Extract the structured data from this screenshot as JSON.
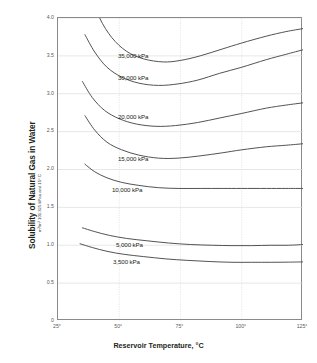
{
  "chart_data": {
    "type": "line",
    "title": "",
    "xlabel": "Reservoir Temperature, °C",
    "ylabel": "Solubility of Natural Gas in Water",
    "ylabel_sub": "m³/m³ 101.325 kPaa and 15° C",
    "xlim": [
      25,
      125
    ],
    "ylim": [
      0,
      4.0
    ],
    "grid": true,
    "legend": "inline-labels",
    "xticks": [
      "25°",
      "50°",
      "75°",
      "100°",
      "125°"
    ],
    "xtick_values": [
      25,
      50,
      75,
      100,
      125
    ],
    "yticks": [
      "0",
      "0.5",
      "1.0",
      "1.5",
      "2.0",
      "2.5",
      "3.0",
      "3.5",
      "4.0"
    ],
    "ytick_values": [
      0,
      0.5,
      1.0,
      1.5,
      2.0,
      2.5,
      3.0,
      3.5,
      4.0
    ],
    "series": [
      {
        "name": "35,000 kPa",
        "label": "35,000 kPa",
        "x": [
          38,
          42,
          47,
          53,
          60,
          68,
          75,
          83,
          92,
          100,
          110,
          118,
          125
        ],
        "y": [
          4.35,
          4.0,
          3.74,
          3.56,
          3.46,
          3.42,
          3.44,
          3.5,
          3.59,
          3.67,
          3.76,
          3.82,
          3.86
        ]
      },
      {
        "name": "30,000 kPa",
        "label": "30,000 kPa",
        "x": [
          36,
          40,
          45,
          51,
          58,
          66,
          74,
          82,
          91,
          100,
          110,
          118,
          125
        ],
        "y": [
          3.78,
          3.55,
          3.35,
          3.22,
          3.14,
          3.11,
          3.13,
          3.18,
          3.27,
          3.35,
          3.45,
          3.52,
          3.58
        ]
      },
      {
        "name": "20,000 kPa",
        "label": "20,000 kPa",
        "x": [
          35,
          39,
          44,
          50,
          57,
          65,
          73,
          82,
          91,
          100,
          110,
          118,
          125
        ],
        "y": [
          3.16,
          2.95,
          2.78,
          2.67,
          2.6,
          2.57,
          2.58,
          2.62,
          2.68,
          2.74,
          2.81,
          2.85,
          2.88
        ]
      },
      {
        "name": "15,000 kPa",
        "label": "15,000 kPa",
        "x": [
          36,
          40,
          45,
          51,
          58,
          66,
          74,
          83,
          92,
          100,
          110,
          118,
          125
        ],
        "y": [
          2.71,
          2.52,
          2.36,
          2.26,
          2.19,
          2.15,
          2.15,
          2.18,
          2.22,
          2.26,
          2.3,
          2.32,
          2.34
        ]
      },
      {
        "name": "10,000 kPa",
        "label": "10,000 kPa",
        "x": [
          36,
          40,
          45,
          51,
          58,
          66,
          74,
          83,
          92,
          100,
          110,
          118,
          125
        ],
        "y": [
          2.07,
          1.97,
          1.89,
          1.83,
          1.79,
          1.76,
          1.75,
          1.75,
          1.75,
          1.75,
          1.75,
          1.75,
          1.75
        ]
      },
      {
        "name": "5,000 kPa",
        "label": "5,000 kPa",
        "x": [
          35,
          40,
          46,
          53,
          61,
          70,
          79,
          88,
          96,
          104,
          112,
          119,
          125
        ],
        "y": [
          1.23,
          1.18,
          1.13,
          1.09,
          1.06,
          1.03,
          1.01,
          1.0,
          0.995,
          0.995,
          1.0,
          1.0,
          1.01
        ]
      },
      {
        "name": "3,500 kPa",
        "label": "3,500 kPa",
        "x": [
          34,
          39,
          45,
          52,
          60,
          69,
          78,
          87,
          96,
          104,
          112,
          119,
          125
        ],
        "y": [
          1.02,
          0.97,
          0.92,
          0.88,
          0.85,
          0.82,
          0.8,
          0.785,
          0.775,
          0.775,
          0.775,
          0.777,
          0.78
        ]
      }
    ],
    "curve_labels": [
      {
        "text": "35,000 kPa",
        "x_px": 118,
        "y_px": 52
      },
      {
        "text": "30,000 kPa",
        "x_px": 118,
        "y_px": 74
      },
      {
        "text": "20,000 kPa",
        "x_px": 118,
        "y_px": 113
      },
      {
        "text": "15,000 kPa",
        "x_px": 118,
        "y_px": 155
      },
      {
        "text": "10,000 kPa",
        "x_px": 112,
        "y_px": 186
      },
      {
        "text": "5,000 kPa",
        "x_px": 116,
        "y_px": 241
      },
      {
        "text": "3,500 kPa",
        "x_px": 113,
        "y_px": 258
      }
    ],
    "colors": {
      "curve": "#4a4a4a",
      "axis": "#8a8a8a",
      "grid": "#dcdcdc",
      "text": "#231f20",
      "tick_text": "#58595b",
      "background": "#ffffff"
    }
  }
}
